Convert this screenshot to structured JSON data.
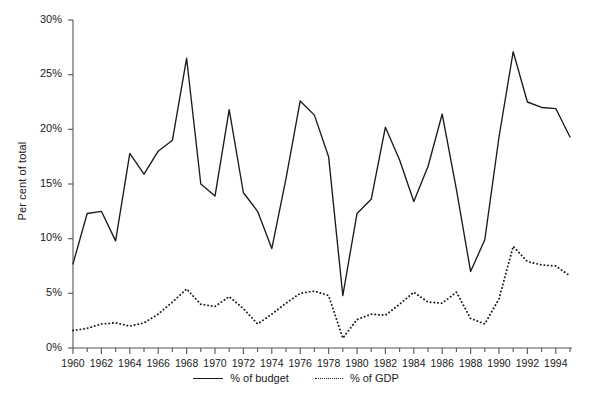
{
  "chart_data": {
    "type": "line",
    "title": "",
    "xlabel": "",
    "ylabel": "Per cent of total",
    "ylim": [
      0,
      30
    ],
    "xlim": [
      1960,
      1995
    ],
    "grid": false,
    "legend_position": "bottom-center",
    "y_tick_labels": [
      "30%",
      "25%",
      "20%",
      "15%",
      "10%",
      "5%",
      "0%"
    ],
    "y_tick_values": [
      30,
      25,
      20,
      15,
      10,
      5,
      0
    ],
    "x_tick_labels": [
      "1960",
      "1962",
      "1964",
      "1966",
      "1968",
      "1970",
      "1972",
      "1974",
      "1976",
      "1978",
      "1980",
      "1982",
      "1984",
      "1986",
      "1988",
      "1990",
      "1992",
      "1994"
    ],
    "x_tick_values": [
      1960,
      1962,
      1964,
      1966,
      1968,
      1970,
      1972,
      1974,
      1976,
      1978,
      1980,
      1982,
      1984,
      1986,
      1988,
      1990,
      1992,
      1994
    ],
    "x": [
      1960,
      1961,
      1962,
      1963,
      1964,
      1965,
      1966,
      1967,
      1968,
      1969,
      1970,
      1971,
      1972,
      1973,
      1974,
      1975,
      1976,
      1977,
      1978,
      1979,
      1980,
      1981,
      1982,
      1983,
      1984,
      1985,
      1986,
      1987,
      1988,
      1989,
      1990,
      1991,
      1992,
      1993,
      1994,
      1995
    ],
    "series": [
      {
        "name": "% of budget",
        "style": "solid",
        "color": "#1a1a1a",
        "values": [
          7.7,
          12.3,
          12.5,
          9.8,
          17.8,
          15.9,
          18.0,
          19.0,
          26.5,
          15.0,
          13.9,
          21.8,
          14.2,
          12.5,
          9.1,
          15.5,
          22.6,
          21.3,
          17.5,
          4.8,
          12.3,
          13.6,
          20.2,
          17.2,
          13.4,
          16.6,
          21.4,
          14.5,
          7.0,
          9.9,
          19.3,
          27.1,
          22.5,
          22.0,
          21.9,
          19.3
        ]
      },
      {
        "name": "% of GDP",
        "style": "dotted",
        "color": "#1a1a1a",
        "values": [
          1.6,
          1.8,
          2.2,
          2.3,
          2.0,
          2.3,
          3.1,
          4.2,
          5.4,
          4.0,
          3.8,
          4.7,
          3.6,
          2.2,
          3.1,
          4.1,
          5.0,
          5.2,
          4.8,
          0.9,
          2.6,
          3.1,
          3.0,
          4.0,
          5.1,
          4.2,
          4.1,
          5.1,
          2.7,
          2.2,
          4.5,
          9.3,
          7.9,
          7.6,
          7.5,
          6.6
        ]
      }
    ]
  },
  "legend": {
    "items": [
      {
        "label": "% of budget",
        "style": "solid"
      },
      {
        "label": "% of GDP",
        "style": "dotted"
      }
    ]
  }
}
